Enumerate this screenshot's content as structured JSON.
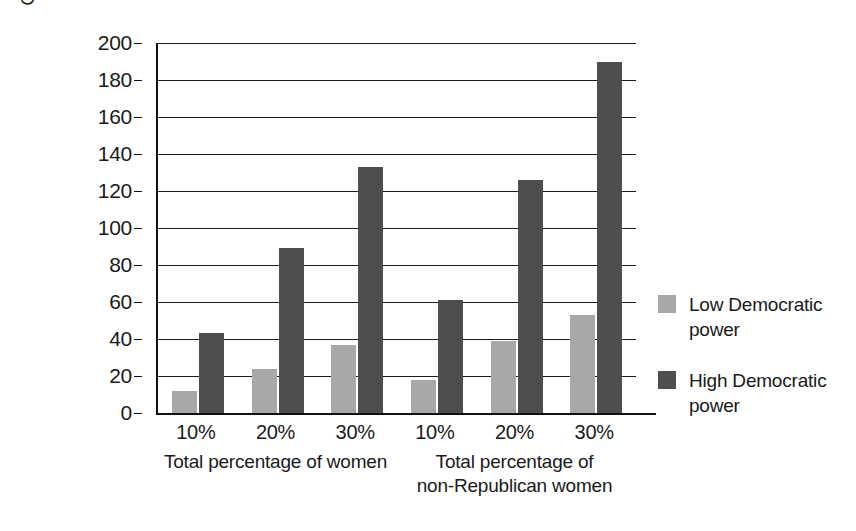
{
  "chart_data": {
    "type": "bar",
    "title": "",
    "xlabel": "",
    "ylabel": "Control over start/quit times",
    "ylim": [
      0,
      200
    ],
    "ytick_labels": [
      "200",
      "180",
      "160",
      "140",
      "120",
      "100",
      "80",
      "60",
      "40",
      "20",
      "0"
    ],
    "ytick_values": [
      200,
      180,
      160,
      140,
      120,
      100,
      80,
      60,
      40,
      20,
      0
    ],
    "grid": true,
    "legend_position": "right",
    "categories": [
      "10%",
      "20%",
      "30%",
      "10%",
      "20%",
      "30%"
    ],
    "groups": [
      {
        "label_line1": "Total percentage of women",
        "label_line2": "",
        "categories": [
          "10%",
          "20%",
          "30%"
        ]
      },
      {
        "label_line1": "Total percentage of",
        "label_line2": "non-Republican women",
        "categories": [
          "10%",
          "20%",
          "30%"
        ]
      }
    ],
    "series": [
      {
        "name": "Low Democratic power",
        "name_line1": "Low Democratic",
        "name_line2": "power",
        "color": "#a8a8a8",
        "values": [
          12,
          24,
          37,
          18,
          39,
          53
        ]
      },
      {
        "name": "High Democratic power",
        "name_line1": "High Democratic",
        "name_line2": "power",
        "color": "#4e4e4e",
        "values": [
          43,
          89,
          133,
          61,
          126,
          190
        ]
      }
    ]
  },
  "legend": {
    "items": [
      {
        "line1": "Low Democratic",
        "line2": "power",
        "swatch": "low"
      },
      {
        "line1": "High Democratic",
        "line2": "power",
        "swatch": "high"
      }
    ]
  }
}
